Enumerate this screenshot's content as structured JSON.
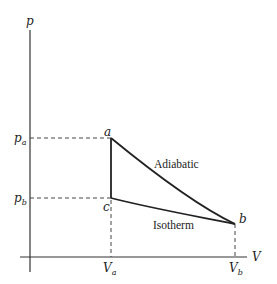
{
  "diagram": {
    "type": "pV-diagram",
    "axes": {
      "y_label": "p",
      "x_label": "V"
    },
    "points": [
      {
        "name": "a",
        "label": "a"
      },
      {
        "name": "b",
        "label": "b"
      },
      {
        "name": "c",
        "label": "c"
      }
    ],
    "ticks": {
      "y": [
        {
          "main": "p",
          "sub": "a"
        },
        {
          "main": "p",
          "sub": "b"
        }
      ],
      "x": [
        {
          "main": "V",
          "sub": "a"
        },
        {
          "main": "V",
          "sub": "b"
        }
      ]
    },
    "curves": {
      "adiabatic": "Adiabatic",
      "isotherm": "Isotherm"
    },
    "colors": {
      "line": "#222222",
      "background": "#ffffff"
    }
  }
}
